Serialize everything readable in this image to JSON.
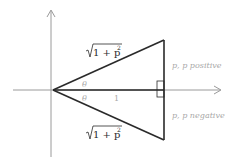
{
  "diagram": {
    "type": "geometry",
    "colors": {
      "axis": "#9a9a9a",
      "triangle": "#2a2a2a",
      "label_gray": "#a8a8a8",
      "label_dark": "#2a2a2a"
    },
    "labels": {
      "hyp_top": "√1 + p²",
      "hyp_top_rad": "1 + p",
      "hyp_bottom_rad": "1 + p",
      "sup": "2",
      "theta_top": "θ",
      "theta_bottom": "θ",
      "base": "1",
      "p_positive": "p, p positive",
      "p_negative": "p, p negative"
    }
  }
}
